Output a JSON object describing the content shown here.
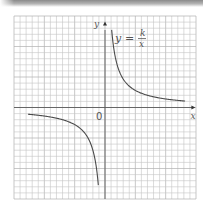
{
  "chart_data": {
    "type": "line",
    "title": "",
    "function": "y = k/x",
    "k": 14,
    "xlabel": "x",
    "ylabel": "y",
    "origin_label": "0",
    "equation_label": {
      "lhs": "y",
      "eq": "=",
      "numerator": "k",
      "denominator": "x"
    },
    "xlim": [
      -15,
      15
    ],
    "ylim": [
      -15,
      15
    ],
    "grid": true,
    "grid_step": 1,
    "series": [
      {
        "name": "branch-quadrant-1",
        "x_range": [
          1.1,
          13.2
        ]
      },
      {
        "name": "branch-quadrant-3",
        "x_range": [
          -12.7,
          -1.1
        ]
      }
    ]
  },
  "colors": {
    "grid": "#c4c4c4",
    "axis": "#5a5a5a",
    "curve": "#4a4a4a",
    "text": "#555555"
  }
}
